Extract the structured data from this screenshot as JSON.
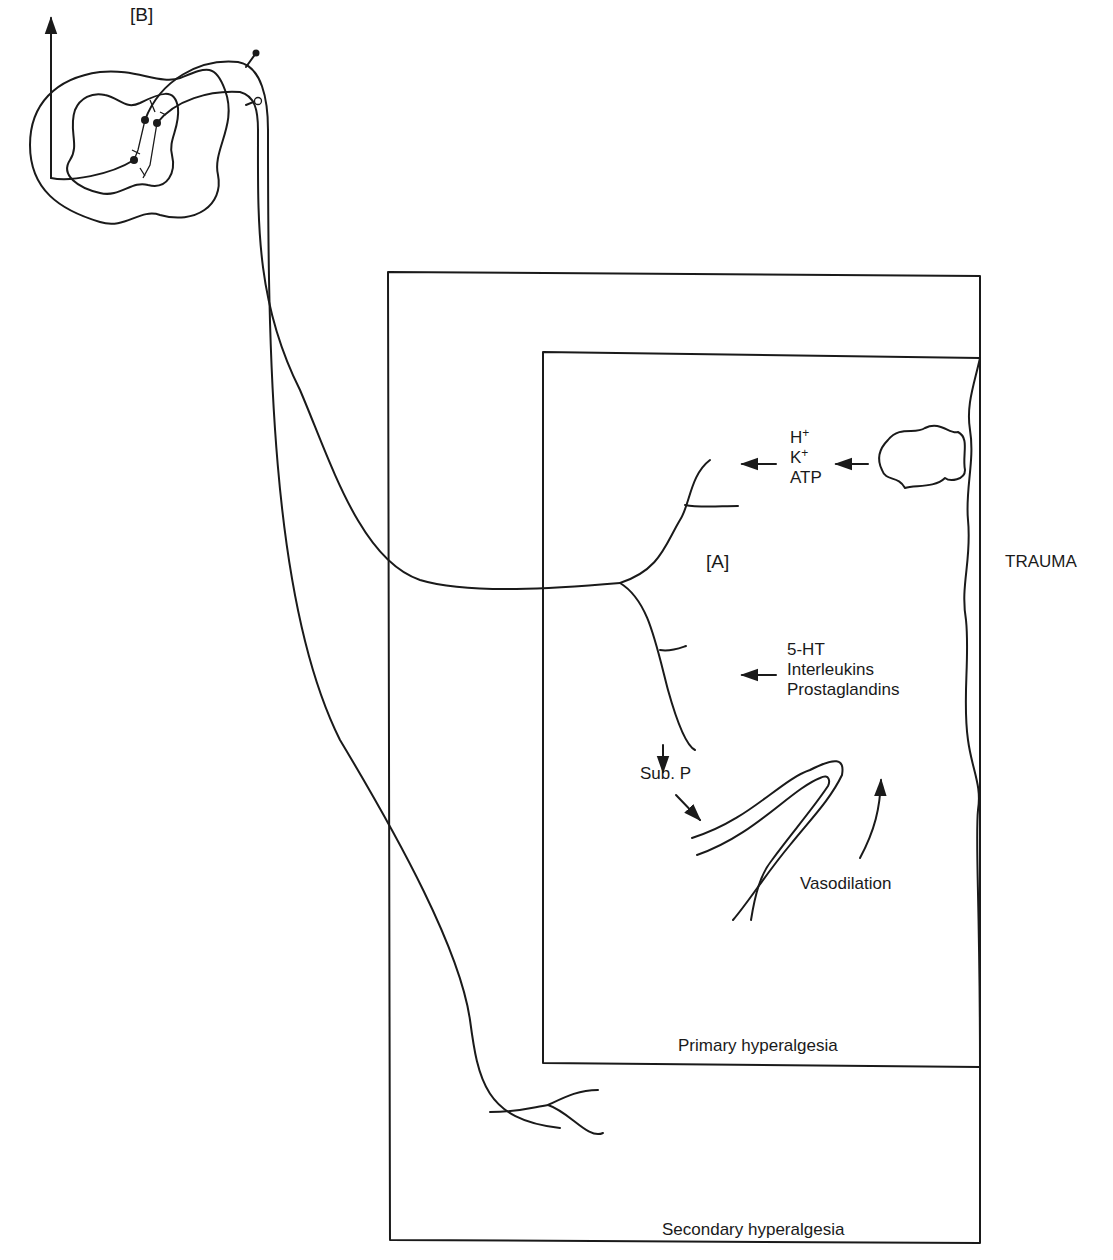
{
  "diagram": {
    "type": "neurophysiology schematic",
    "labels": {
      "spinal_cord": "[B]",
      "tissue_site": "[A]",
      "trauma": "TRAUMA",
      "primary_zone": "Primary hyperalgesia",
      "secondary_zone": "Secondary hyperalgesia",
      "substance_p": "Sub. P",
      "vasodilation": "Vasodilation"
    },
    "ions_group": {
      "h": "H",
      "h_charge": "+",
      "k": "K",
      "k_charge": "+",
      "atp": "ATP"
    },
    "mediators_group": {
      "items": [
        "5-HT",
        "Interleukins",
        "Prostaglandins"
      ]
    },
    "regions": [
      {
        "name": "Secondary hyperalgesia",
        "type": "outer-box"
      },
      {
        "name": "Primary hyperalgesia",
        "type": "inner-box"
      }
    ],
    "colors": {
      "ink": "#1a1a1a",
      "background": "#ffffff"
    }
  }
}
